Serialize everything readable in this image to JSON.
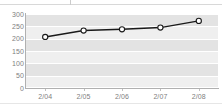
{
  "chart_data": {
    "type": "line",
    "title": "",
    "xlabel": "",
    "ylabel": "",
    "categories": [
      "2/04",
      "2/05",
      "2/06",
      "2/07",
      "2/08"
    ],
    "series": [
      {
        "name": "series-1",
        "values": [
          207,
          233,
          238,
          245,
          272
        ],
        "line_color": "#1a1a1a",
        "marker": "open-circle",
        "marker_fill": "#ffffff",
        "marker_edge": "#1a1a1a"
      }
    ],
    "ylim": [
      0,
      300
    ],
    "yticks": [
      0,
      50,
      100,
      150,
      200,
      250,
      300
    ],
    "ytick_labels": [
      "0",
      "50",
      "100",
      "150",
      "200",
      "250",
      "300"
    ],
    "xticks": [
      "2/04",
      "2/05",
      "2/06",
      "2/07",
      "2/08"
    ],
    "grid": true,
    "grid_color": "#ffffff",
    "legend": "none",
    "plot_background": "#efefef",
    "band_color": "#e3e3e3",
    "axis_color": "#b0b0b0",
    "tick_label_color": "#808080"
  },
  "top_clip": {
    "text": ""
  }
}
